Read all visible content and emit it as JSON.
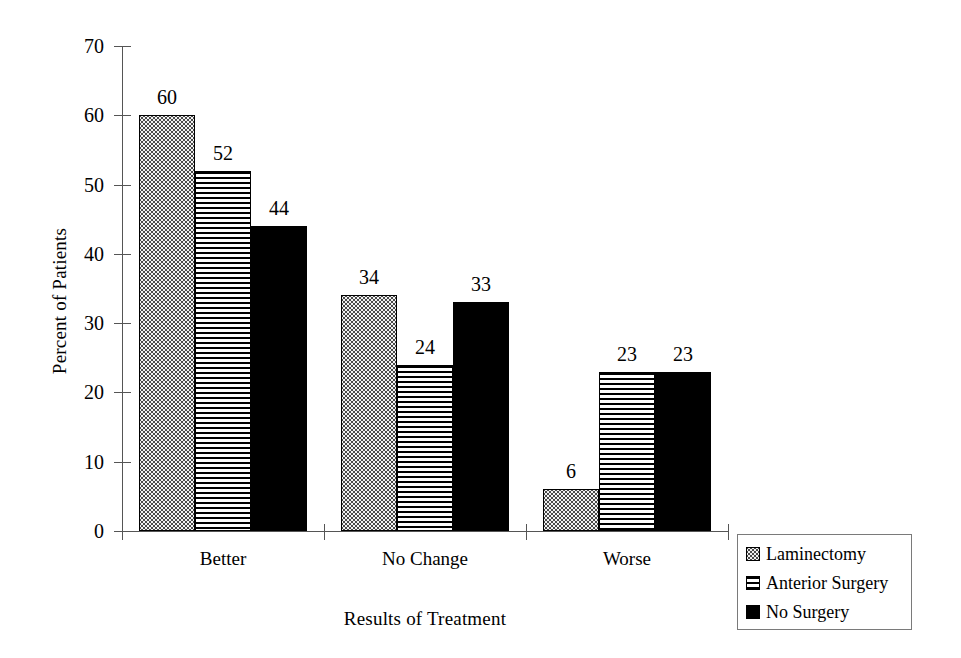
{
  "chart_data": {
    "type": "bar",
    "title": "",
    "xlabel": "Results of Treatment",
    "ylabel": "Percent of Patients",
    "categories": [
      "Better",
      "No Change",
      "Worse"
    ],
    "series": [
      {
        "name": "Laminectomy",
        "pattern": "dotted",
        "values": [
          60,
          34,
          6
        ]
      },
      {
        "name": "Anterior Surgery",
        "pattern": "striped",
        "values": [
          52,
          24,
          23
        ]
      },
      {
        "name": "No Surgery",
        "pattern": "solid",
        "values": [
          44,
          33,
          23
        ]
      }
    ],
    "ylim": [
      0,
      70
    ],
    "yticks": [
      0,
      10,
      20,
      30,
      40,
      50,
      60,
      70
    ],
    "ytick_labels": [
      "0",
      "10",
      "20",
      "30",
      "40",
      "50",
      "60",
      "70"
    ],
    "grid": false,
    "legend_position": "bottom-right",
    "data_labels": true
  },
  "axes": {
    "y_label": "Percent of Patients",
    "x_label": "Results of Treatment"
  },
  "legend": {
    "entries": [
      {
        "label": "Laminectomy"
      },
      {
        "label": "Anterior Surgery"
      },
      {
        "label": "No Surgery"
      }
    ]
  }
}
